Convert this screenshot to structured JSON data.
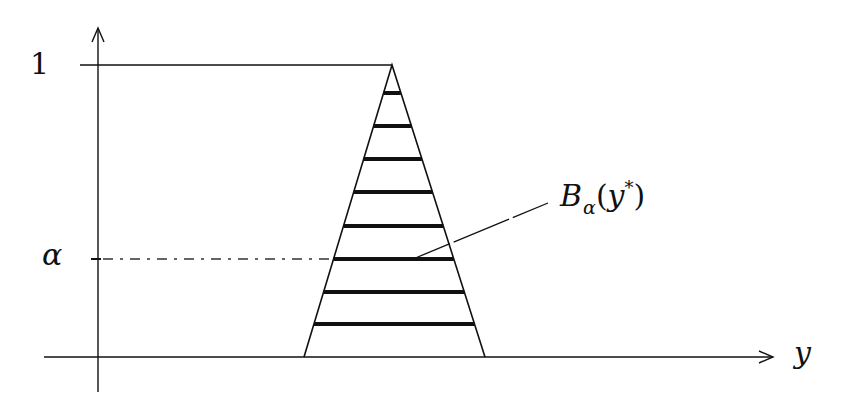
{
  "diagram": {
    "type": "fuzzy-membership-triangle",
    "axes": {
      "vertical_tick_labels": {
        "top": "1",
        "alpha": "α"
      },
      "horizontal_axis_label": "y"
    },
    "annotation": {
      "set_symbol": "B",
      "set_subscript": "α",
      "open_paren": "(",
      "argument": "y",
      "superscript": "*",
      "close_paren": ")"
    },
    "geometry": {
      "y_axis": {
        "x": 98,
        "y_top": 28,
        "y_bottom": 392
      },
      "x_axis": {
        "y": 357,
        "x_left": 44,
        "x_right": 773
      },
      "level_one_line": {
        "y": 65,
        "x_left": 80,
        "x_right": 392
      },
      "triangle": {
        "apex": [
          392,
          65
        ],
        "base_left": [
          304,
          357
        ],
        "base_right": [
          485,
          357
        ]
      },
      "alpha_cut_levels_y": [
        93,
        126,
        159,
        192,
        226,
        259,
        292,
        324
      ],
      "alpha_level_y": 259,
      "alpha_dashed_line": {
        "x_from": 91,
        "x_to": 333
      },
      "leader_line": {
        "from": [
          413,
          259
        ],
        "to": [
          548,
          203
        ]
      }
    },
    "colors": {
      "ink": "#111111",
      "background": "#ffffff"
    }
  }
}
